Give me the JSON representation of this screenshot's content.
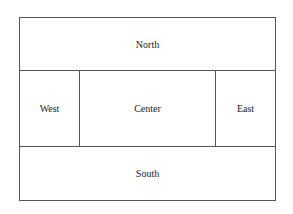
{
  "regions": {
    "north": "North",
    "west": "West",
    "center": "Center",
    "east": "East",
    "south": "South"
  }
}
